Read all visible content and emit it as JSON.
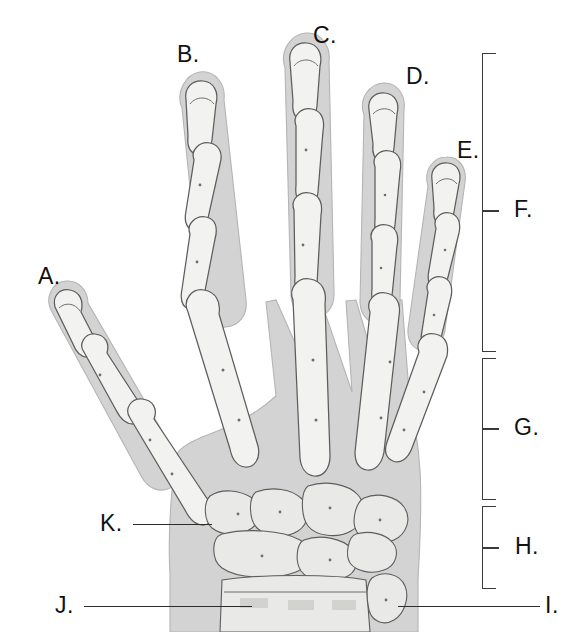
{
  "figure": {
    "style": "grayscale-medical-illustration",
    "width": 574,
    "height": 632,
    "background_color": "#ffffff",
    "line_color": "#2b2b2b",
    "bone_fill": "#f2f2f0",
    "soft_tissue_fill": "#d3d3d3"
  },
  "labels": [
    {
      "id": "A",
      "text": "A.",
      "x": 38,
      "y": 265,
      "has_leader": false,
      "anchor": "thumb-distal-phalanx"
    },
    {
      "id": "B",
      "text": "B.",
      "x": 177,
      "y": 43,
      "has_leader": false,
      "anchor": "index-finger-tip"
    },
    {
      "id": "C",
      "text": "C.",
      "x": 313,
      "y": 24,
      "has_leader": false,
      "anchor": "middle-finger-tip"
    },
    {
      "id": "D",
      "text": "D.",
      "x": 406,
      "y": 65,
      "has_leader": false,
      "anchor": "ring-finger-tip"
    },
    {
      "id": "E",
      "text": "E.",
      "x": 457,
      "y": 139,
      "has_leader": false,
      "anchor": "little-finger-tip"
    },
    {
      "id": "F",
      "text": "F.",
      "x": 514,
      "y": 198,
      "has_leader": false,
      "anchor": "phalanges-region"
    },
    {
      "id": "G",
      "text": "G.",
      "x": 514,
      "y": 416,
      "has_leader": false,
      "anchor": "metacarpals-region"
    },
    {
      "id": "H",
      "text": "H.",
      "x": 515,
      "y": 535,
      "has_leader": false,
      "anchor": "carpals-region"
    },
    {
      "id": "I",
      "text": "I.",
      "x": 545,
      "y": 594,
      "has_leader": true,
      "anchor": "ulna-styloid"
    },
    {
      "id": "J",
      "text": "J.",
      "x": 55,
      "y": 594,
      "has_leader": true,
      "anchor": "radius"
    },
    {
      "id": "K",
      "text": "K.",
      "x": 100,
      "y": 512,
      "has_leader": true,
      "anchor": "trapezium"
    }
  ],
  "leader_lines": [
    {
      "id": "leader-K",
      "x1": 133,
      "y1": 524,
      "x2": 212,
      "y2": 524
    },
    {
      "id": "leader-J",
      "x1": 84,
      "y1": 606,
      "x2": 252,
      "y2": 606
    },
    {
      "id": "leader-I",
      "x1": 398,
      "y1": 606,
      "x2": 540,
      "y2": 606
    }
  ],
  "brackets": [
    {
      "id": "bracket-F",
      "label": "F.",
      "top": 53,
      "bottom": 352,
      "tick_y": 210,
      "x": 482,
      "width": 14
    },
    {
      "id": "bracket-G",
      "label": "G.",
      "top": 358,
      "bottom": 500,
      "tick_y": 428,
      "x": 482,
      "width": 14
    },
    {
      "id": "bracket-H",
      "label": "H.",
      "top": 506,
      "bottom": 589,
      "tick_y": 547,
      "x": 482,
      "width": 14
    }
  ],
  "regions": {
    "F": "phalanges",
    "G": "metacarpals",
    "H": "carpals"
  }
}
